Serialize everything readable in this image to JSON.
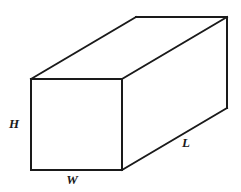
{
  "figure": {
    "name": "rectangular-prism-diagram",
    "background_color": "#ffffff",
    "stroke_color": "#1a1a1a",
    "stroke_width": 2,
    "canvas": {
      "width": 241,
      "height": 192
    },
    "vertices": {
      "front_top_left": {
        "x": 31,
        "y": 79
      },
      "front_top_right": {
        "x": 122,
        "y": 79
      },
      "front_bottom_right": {
        "x": 122,
        "y": 170
      },
      "front_bottom_left": {
        "x": 31,
        "y": 170
      },
      "back_top_left": {
        "x": 136,
        "y": 17
      },
      "back_top_right": {
        "x": 227,
        "y": 17
      },
      "back_bottom_right": {
        "x": 227,
        "y": 108
      },
      "back_bottom_left": {
        "x": 136,
        "y": 108
      }
    },
    "edges": [
      {
        "name": "front-face-top-edge",
        "from": "front_top_left",
        "to": "front_top_right",
        "visible": true
      },
      {
        "name": "front-face-right-edge",
        "from": "front_top_right",
        "to": "front_bottom_right",
        "visible": true
      },
      {
        "name": "front-face-bottom-edge",
        "from": "front_bottom_right",
        "to": "front_bottom_left",
        "visible": true
      },
      {
        "name": "front-face-left-edge",
        "from": "front_bottom_left",
        "to": "front_top_left",
        "visible": true
      },
      {
        "name": "top-left-depth-edge",
        "from": "front_top_left",
        "to": "back_top_left",
        "visible": true
      },
      {
        "name": "top-right-depth-edge",
        "from": "front_top_right",
        "to": "back_top_right",
        "visible": true
      },
      {
        "name": "bottom-right-depth-edge",
        "from": "front_bottom_right",
        "to": "back_bottom_right",
        "visible": true
      },
      {
        "name": "back-face-top-edge",
        "from": "back_top_left",
        "to": "back_top_right",
        "visible": true
      },
      {
        "name": "back-face-right-edge",
        "from": "back_top_right",
        "to": "back_bottom_right",
        "visible": true
      }
    ],
    "labels": {
      "height": {
        "text": "H",
        "x": 14,
        "y": 125,
        "meaning": "height of the prism, front-left vertical edge"
      },
      "width": {
        "text": "W",
        "x": 72,
        "y": 181,
        "meaning": "width of the prism, front-bottom horizontal edge"
      },
      "length": {
        "text": "L",
        "x": 186,
        "y": 144,
        "meaning": "length/depth of the prism, bottom-right receding edge"
      }
    }
  }
}
